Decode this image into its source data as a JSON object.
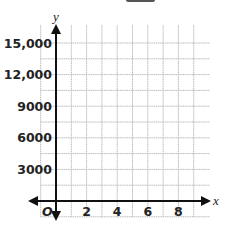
{
  "chart_data": {
    "type": "scatter",
    "title": "",
    "xlabel": "x",
    "ylabel": "y",
    "origin_label": "O",
    "x_ticks": [
      2,
      4,
      6,
      8
    ],
    "x_tick_labels": [
      "2",
      "4",
      "6",
      "8"
    ],
    "y_ticks": [
      3000,
      6000,
      9000,
      12000,
      15000
    ],
    "y_tick_labels": [
      "3000",
      "6000",
      "9000",
      "12,000",
      "15,000"
    ],
    "x_grid_step": 1,
    "y_grid_step": 1500,
    "xlim": [
      -1,
      9.5
    ],
    "ylim": [
      -1500,
      15500
    ],
    "grid": true,
    "series": [],
    "colors": {
      "axis": "#111111",
      "grid": "#b8b8b8",
      "text": "#222222"
    }
  }
}
